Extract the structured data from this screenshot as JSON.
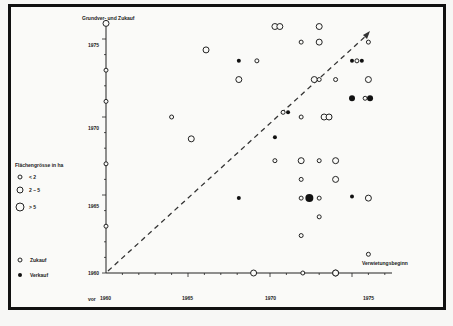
{
  "chart_data": {
    "type": "scatter",
    "title": "",
    "ylabel": "Grundver- und Zukauf",
    "xlabel": "Verwietungsbeginn",
    "x_tick_labels": [
      "vor 1960",
      "1965",
      "1970",
      "1975"
    ],
    "y_tick_labels": [
      "1960",
      "1965",
      "1970",
      "1975"
    ],
    "xlim": [
      1960,
      1977
    ],
    "ylim": [
      1960,
      1976
    ],
    "grid": false,
    "diagonal_reference": "dashed line y = x with arrow",
    "legend": {
      "size_title": "Flächengrösse in ha",
      "sizes": [
        {
          "label": "< 2",
          "r": 2
        },
        {
          "label": "2 – 5",
          "r": 3
        },
        {
          "label": "> 5",
          "r": 4
        }
      ],
      "types": [
        {
          "label": "Zukauf",
          "marker": "open"
        },
        {
          "label": "Verkauf",
          "marker": "filled"
        }
      ]
    },
    "points": [
      {
        "x": 1970.3,
        "y": 1975.8,
        "size": "2-5",
        "type": "Zukauf"
      },
      {
        "x": 1970.6,
        "y": 1975.8,
        "size": "2-5",
        "type": "Zukauf"
      },
      {
        "x": 1966.1,
        "y": 1974.3,
        "size": "2-5",
        "type": "Zukauf"
      },
      {
        "x": 1968.1,
        "y": 1973.6,
        "size": "<2",
        "type": "Verkauf"
      },
      {
        "x": 1969.2,
        "y": 1973.6,
        "size": "<2",
        "type": "Zukauf"
      },
      {
        "x": 1968.1,
        "y": 1972.4,
        "size": "2-5",
        "type": "Zukauf"
      },
      {
        "x": 1973.0,
        "y": 1975.8,
        "size": "2-5",
        "type": "Zukauf"
      },
      {
        "x": 1971.9,
        "y": 1974.8,
        "size": "<2",
        "type": "Zukauf"
      },
      {
        "x": 1973.0,
        "y": 1974.8,
        "size": "2-5",
        "type": "Zukauf"
      },
      {
        "x": 1976.0,
        "y": 1974.8,
        "size": "<2",
        "type": "Zukauf"
      },
      {
        "x": 1972.7,
        "y": 1972.4,
        "size": "2-5",
        "type": "Zukauf"
      },
      {
        "x": 1973.0,
        "y": 1972.4,
        "size": "<2",
        "type": "Zukauf"
      },
      {
        "x": 1974.0,
        "y": 1972.4,
        "size": "<2",
        "type": "Zukauf"
      },
      {
        "x": 1975.0,
        "y": 1973.6,
        "size": "<2",
        "type": "Verkauf"
      },
      {
        "x": 1975.3,
        "y": 1973.6,
        "size": "<2",
        "type": "Zukauf"
      },
      {
        "x": 1975.6,
        "y": 1973.6,
        "size": "<2",
        "type": "Verkauf"
      },
      {
        "x": 1976.0,
        "y": 1972.4,
        "size": "2-5",
        "type": "Zukauf"
      },
      {
        "x": 1975.0,
        "y": 1971.2,
        "size": "2-5",
        "type": "Verkauf"
      },
      {
        "x": 1975.8,
        "y": 1971.2,
        "size": "<2",
        "type": "Zukauf"
      },
      {
        "x": 1976.1,
        "y": 1971.2,
        "size": "2-5",
        "type": "Verkauf"
      },
      {
        "x": 1964.0,
        "y": 1970.0,
        "size": "<2",
        "type": "Zukauf"
      },
      {
        "x": 1965.2,
        "y": 1968.6,
        "size": "2-5",
        "type": "Zukauf"
      },
      {
        "x": 1970.8,
        "y": 1970.3,
        "size": "<2",
        "type": "Zukauf"
      },
      {
        "x": 1971.1,
        "y": 1970.3,
        "size": "<2",
        "type": "Verkauf"
      },
      {
        "x": 1970.3,
        "y": 1968.7,
        "size": "<2",
        "type": "Verkauf"
      },
      {
        "x": 1971.9,
        "y": 1970.0,
        "size": "<2",
        "type": "Zukauf"
      },
      {
        "x": 1973.3,
        "y": 1970.0,
        "size": "2-5",
        "type": "Zukauf"
      },
      {
        "x": 1973.6,
        "y": 1970.0,
        "size": "2-5",
        "type": "Zukauf"
      },
      {
        "x": 1970.3,
        "y": 1967.2,
        "size": "<2",
        "type": "Zukauf"
      },
      {
        "x": 1971.9,
        "y": 1967.2,
        "size": "2-5",
        "type": "Zukauf"
      },
      {
        "x": 1973.0,
        "y": 1967.2,
        "size": "<2",
        "type": "Zukauf"
      },
      {
        "x": 1974.0,
        "y": 1967.2,
        "size": "2-5",
        "type": "Zukauf"
      },
      {
        "x": 1971.9,
        "y": 1966.0,
        "size": "<2",
        "type": "Zukauf"
      },
      {
        "x": 1974.0,
        "y": 1966.0,
        "size": "2-5",
        "type": "Zukauf"
      },
      {
        "x": 1968.1,
        "y": 1964.8,
        "size": "<2",
        "type": "Verkauf"
      },
      {
        "x": 1971.9,
        "y": 1964.8,
        "size": "<2",
        "type": "Zukauf"
      },
      {
        "x": 1972.4,
        "y": 1964.8,
        "size": ">5",
        "type": "Verkauf"
      },
      {
        "x": 1973.0,
        "y": 1964.8,
        "size": "<2",
        "type": "Zukauf"
      },
      {
        "x": 1975.0,
        "y": 1964.9,
        "size": "<2",
        "type": "Verkauf"
      },
      {
        "x": 1976.0,
        "y": 1964.8,
        "size": "2-5",
        "type": "Zukauf"
      },
      {
        "x": 1973.0,
        "y": 1963.6,
        "size": "<2",
        "type": "Zukauf"
      },
      {
        "x": 1971.9,
        "y": 1962.4,
        "size": "<2",
        "type": "Zukauf"
      },
      {
        "x": 1976.0,
        "y": 1961.2,
        "size": "<2",
        "type": "Zukauf"
      },
      {
        "x": 1974.0,
        "y": 1960.0,
        "size": "2-5",
        "type": "Zukauf"
      }
    ],
    "y_axis_points": [
      {
        "y": 1976.0,
        "size": "2-5",
        "type": "Zukauf"
      },
      {
        "y": 1973.0,
        "size": "<2",
        "type": "Zukauf"
      },
      {
        "y": 1971.0,
        "size": "<2",
        "type": "Zukauf"
      },
      {
        "y": 1967.0,
        "size": "<2",
        "type": "Zukauf"
      },
      {
        "y": 1963.0,
        "size": "<2",
        "type": "Zukauf"
      }
    ],
    "x_axis_points": [
      {
        "x": 1969.0,
        "size": "2-5",
        "type": "Zukauf"
      },
      {
        "x": 1972.0,
        "size": "<2",
        "type": "Zukauf"
      },
      {
        "x": 1974.0,
        "size": "2-5",
        "type": "Zukauf"
      }
    ]
  },
  "labels": {
    "y_axis_title": "Grundver- und Zukauf",
    "x_axis_title": "Verwietungsbeginn",
    "x_origin_prefix": "vor",
    "x_ticks": [
      "1960",
      "1965",
      "1970",
      "1975"
    ],
    "y_ticks": [
      "1960",
      "1965",
      "1970",
      "1975"
    ],
    "legend_size_title": "Flächengrösse  in ha",
    "legend_small": "< 2",
    "legend_medium": "2 – 5",
    "legend_large": "> 5",
    "legend_zukauf": "Zukauf",
    "legend_verkauf": "Verkauf"
  }
}
